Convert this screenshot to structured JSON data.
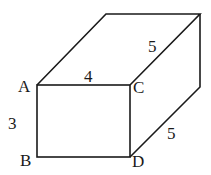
{
  "figure": {
    "type": "rectangular-prism",
    "vertex_labels": {
      "A": "A",
      "B": "B",
      "C": "C",
      "D": "D"
    },
    "edge_labels": {
      "AB": "3",
      "AC": "4",
      "top_depth": "5",
      "bottom_depth": "5"
    },
    "stroke_color": "#1a1a1a"
  }
}
